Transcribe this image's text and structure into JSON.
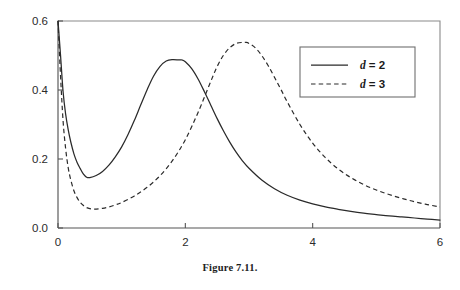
{
  "figure": {
    "caption": "Figure 7.11."
  },
  "chart_data": {
    "type": "line",
    "title": "",
    "xlabel": "",
    "ylabel": "",
    "xlim": [
      0,
      6
    ],
    "ylim": [
      0,
      0.6
    ],
    "xticks": [
      0,
      2,
      4,
      6
    ],
    "xtick_labels": [
      "0",
      "2",
      "4",
      "6"
    ],
    "yticks": [
      0.0,
      0.2,
      0.4,
      0.6
    ],
    "ytick_labels": [
      "0.0",
      "0.2",
      "0.4",
      "0.6"
    ],
    "grid": false,
    "frame": "box",
    "legend_position": "top-right",
    "legend": [
      {
        "label": "d = 2",
        "variable": "d",
        "equals": "= 2",
        "style": "solid"
      },
      {
        "label": "d = 3",
        "variable": "d",
        "equals": "= 3",
        "style": "dashed"
      }
    ],
    "series": [
      {
        "name": "d = 2",
        "style": "solid",
        "peak_x": 1.95,
        "peak_y": 0.487,
        "min_x": 0.45,
        "min_y": 0.146,
        "x": [
          0.0,
          0.04,
          0.08,
          0.12,
          0.16,
          0.2,
          0.25,
          0.3,
          0.35,
          0.4,
          0.45,
          0.5,
          0.6,
          0.7,
          0.8,
          0.9,
          1.0,
          1.1,
          1.2,
          1.3,
          1.4,
          1.5,
          1.6,
          1.7,
          1.8,
          1.9,
          1.95,
          2.0,
          2.1,
          2.2,
          2.3,
          2.4,
          2.5,
          2.6,
          2.7,
          2.8,
          2.9,
          3.0,
          3.2,
          3.4,
          3.6,
          3.8,
          4.0,
          4.2,
          4.4,
          4.6,
          4.8,
          5.0,
          5.2,
          5.4,
          5.6,
          5.8,
          6.0
        ],
        "y": [
          0.62,
          0.5,
          0.395,
          0.33,
          0.285,
          0.25,
          0.215,
          0.19,
          0.172,
          0.156,
          0.147,
          0.146,
          0.152,
          0.164,
          0.182,
          0.206,
          0.235,
          0.271,
          0.312,
          0.357,
          0.401,
          0.44,
          0.468,
          0.484,
          0.488,
          0.487,
          0.487,
          0.482,
          0.462,
          0.432,
          0.395,
          0.356,
          0.317,
          0.281,
          0.248,
          0.219,
          0.194,
          0.173,
          0.139,
          0.114,
          0.095,
          0.081,
          0.07,
          0.061,
          0.054,
          0.048,
          0.043,
          0.039,
          0.035,
          0.032,
          0.029,
          0.026,
          0.023
        ]
      },
      {
        "name": "d = 3",
        "style": "dashed",
        "peak_x": 2.95,
        "peak_y": 0.538,
        "min_x": 0.55,
        "min_y": 0.055,
        "x": [
          0.0,
          0.04,
          0.08,
          0.12,
          0.16,
          0.2,
          0.25,
          0.3,
          0.35,
          0.4,
          0.45,
          0.5,
          0.55,
          0.6,
          0.7,
          0.8,
          0.9,
          1.0,
          1.2,
          1.4,
          1.6,
          1.8,
          2.0,
          2.2,
          2.4,
          2.5,
          2.6,
          2.7,
          2.8,
          2.9,
          2.95,
          3.0,
          3.1,
          3.2,
          3.3,
          3.4,
          3.5,
          3.6,
          3.8,
          4.0,
          4.2,
          4.4,
          4.6,
          4.8,
          5.0,
          5.2,
          5.4,
          5.6,
          5.8,
          6.0
        ],
        "y": [
          0.62,
          0.44,
          0.31,
          0.23,
          0.175,
          0.14,
          0.108,
          0.088,
          0.074,
          0.065,
          0.059,
          0.056,
          0.055,
          0.055,
          0.057,
          0.061,
          0.067,
          0.074,
          0.093,
          0.118,
          0.151,
          0.196,
          0.256,
          0.335,
          0.425,
          0.468,
          0.501,
          0.523,
          0.535,
          0.538,
          0.538,
          0.535,
          0.522,
          0.5,
          0.471,
          0.437,
          0.402,
          0.366,
          0.3,
          0.246,
          0.204,
          0.171,
          0.146,
          0.126,
          0.11,
          0.097,
          0.086,
          0.076,
          0.068,
          0.061
        ]
      }
    ]
  },
  "axes_geometry": {
    "plot_left_px": 58,
    "plot_right_px": 440,
    "plot_top_px": 21,
    "plot_bottom_px": 228
  }
}
